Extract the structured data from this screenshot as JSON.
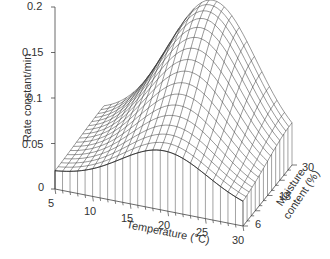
{
  "chart_data": {
    "type": "surface3d",
    "render_style": "wireframe",
    "ylabel": "Rate constant/min",
    "xlabel": "Temperature (°C)",
    "zlabel_line1": "Moisture",
    "zlabel_line2": "content (%)",
    "y_ticks": [
      "0",
      "0.05",
      "0.1",
      "0.15",
      "0.2"
    ],
    "y_tick_values": [
      0,
      0.05,
      0.1,
      0.15,
      0.2
    ],
    "ylim": [
      0,
      0.2
    ],
    "x_ticks": [
      "5",
      "10",
      "15",
      "20",
      "25",
      "30"
    ],
    "x_tick_values": [
      5,
      10,
      15,
      20,
      25,
      30
    ],
    "xlim": [
      5,
      30
    ],
    "z_ticks": [
      "6",
      "18",
      "30"
    ],
    "z_tick_values": [
      6,
      18,
      30
    ],
    "zlim": [
      6,
      30
    ],
    "grid": false,
    "legend": null,
    "estimated_peak": {
      "temperature": 20,
      "moisture": 30,
      "rate": 0.164,
      "note": "visual estimate"
    },
    "surface_model": {
      "note": "Illustrative Gaussian-type model fitted by eye to approximate the rendered shape; not measured data",
      "base": 0.018,
      "amp": 0.146,
      "t_center": 19.5,
      "t_sigma": 5.8,
      "m_center": 30,
      "m_sigma": 12
    }
  }
}
